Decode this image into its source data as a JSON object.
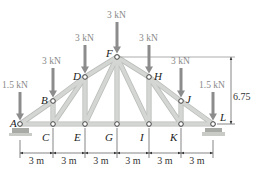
{
  "figure": {
    "type": "roof-truss",
    "colors": {
      "member": "#d4d6d3",
      "member_edge": "#b9bcb8",
      "load_arrow": "#8c8c8c",
      "load_text": "#8a8a8a",
      "dim_line": "#333333",
      "support": "#a8aaa6",
      "node_fill": "#ffffff",
      "node_stroke": "#333333"
    },
    "nodes": [
      {
        "id": "A",
        "label": "A",
        "x": 20,
        "y": 124
      },
      {
        "id": "B",
        "label": "B",
        "x": 53,
        "y": 101
      },
      {
        "id": "C",
        "label": "C",
        "x": 53,
        "y": 124
      },
      {
        "id": "D",
        "label": "D",
        "x": 85,
        "y": 77
      },
      {
        "id": "E",
        "label": "E",
        "x": 85,
        "y": 124
      },
      {
        "id": "F",
        "label": "F",
        "x": 117,
        "y": 57
      },
      {
        "id": "G",
        "label": "G",
        "x": 117,
        "y": 124
      },
      {
        "id": "H",
        "label": "H",
        "x": 149,
        "y": 77
      },
      {
        "id": "I",
        "label": "I",
        "x": 149,
        "y": 124
      },
      {
        "id": "J",
        "label": "J",
        "x": 181,
        "y": 101
      },
      {
        "id": "K",
        "label": "K",
        "x": 181,
        "y": 124
      },
      {
        "id": "L",
        "label": "L",
        "x": 213,
        "y": 124
      }
    ],
    "members": [
      [
        "A",
        "B"
      ],
      [
        "B",
        "D"
      ],
      [
        "D",
        "F"
      ],
      [
        "F",
        "H"
      ],
      [
        "H",
        "J"
      ],
      [
        "J",
        "L"
      ],
      [
        "A",
        "C"
      ],
      [
        "C",
        "E"
      ],
      [
        "E",
        "G"
      ],
      [
        "G",
        "I"
      ],
      [
        "I",
        "K"
      ],
      [
        "K",
        "L"
      ],
      [
        "B",
        "C"
      ],
      [
        "D",
        "E"
      ],
      [
        "F",
        "G"
      ],
      [
        "H",
        "I"
      ],
      [
        "J",
        "K"
      ],
      [
        "C",
        "D"
      ],
      [
        "E",
        "F"
      ],
      [
        "F",
        "I"
      ],
      [
        "H",
        "K"
      ]
    ],
    "loads": [
      {
        "node": "A",
        "label": "1.5 kN",
        "label_x": 2,
        "label_y": 88
      },
      {
        "node": "B",
        "label": "3 kN",
        "label_x": 42,
        "label_y": 64
      },
      {
        "node": "D",
        "label": "3 kN",
        "label_x": 75,
        "label_y": 41
      },
      {
        "node": "F",
        "label": "3 kN",
        "label_x": 107,
        "label_y": 18
      },
      {
        "node": "H",
        "label": "3 kN",
        "label_x": 139,
        "label_y": 41
      },
      {
        "node": "J",
        "label": "3 kN",
        "label_x": 171,
        "label_y": 64
      },
      {
        "node": "L",
        "label": "1.5 kN",
        "label_x": 199,
        "label_y": 88
      }
    ],
    "height_dimension": {
      "label": "6.75 m",
      "x": 231,
      "y_top": 57,
      "y_bottom": 124
    },
    "span_dimensions": {
      "y": 153,
      "labels": [
        "3 m",
        "3 m",
        "3 m",
        "3 m",
        "3 m",
        "3 m"
      ],
      "x_points": [
        20,
        53,
        85,
        117,
        149,
        181,
        213
      ]
    },
    "node_label_positions": {
      "A": [
        10,
        127
      ],
      "B": [
        41,
        104
      ],
      "C": [
        42,
        141
      ],
      "D": [
        73,
        80
      ],
      "E": [
        74,
        141
      ],
      "F": [
        106,
        57
      ],
      "G": [
        105,
        141
      ],
      "H": [
        154,
        80
      ],
      "I": [
        140,
        141
      ],
      "J": [
        186,
        103
      ],
      "K": [
        170,
        141
      ],
      "L": [
        220,
        121
      ]
    }
  }
}
